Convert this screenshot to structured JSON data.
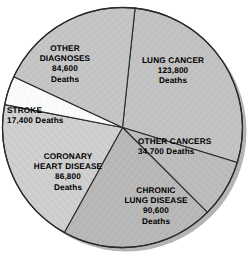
{
  "chart_data": {
    "type": "pie",
    "title": "",
    "subtitle": "",
    "xlabel": "",
    "ylabel": "",
    "unit": "Deaths",
    "total": 437900,
    "legend_position": "none",
    "grid": false,
    "labels_inside_slices": true,
    "categories": [
      "LUNG CANCER",
      "OTHER CANCERS",
      "CHRONIC LUNG DISEASE",
      "CORONARY HEART DISEASE",
      "STROKE",
      "OTHER DIAGNOSES"
    ],
    "values": [
      123800,
      34700,
      90600,
      86800,
      17400,
      84600
    ],
    "value_labels": [
      "123,800",
      "34,700",
      "90,600",
      "86,800",
      "17,400",
      "84,600"
    ],
    "slices": [
      {
        "name": "lung-cancer",
        "label_lines": [
          "LUNG CANCER",
          "123,800",
          "Deaths"
        ],
        "category": "LUNG CANCER",
        "value": 123800,
        "value_label": "123,800",
        "unit": "Deaths",
        "percent": 28.3,
        "start_angle": -84,
        "end_angle": 17,
        "fill": "#c3c3c3"
      },
      {
        "name": "other-cancers",
        "label_lines": [
          "OTHER CANCERS",
          "34,700 Deaths"
        ],
        "category": "OTHER CANCERS",
        "value": 34700,
        "value_label": "34,700",
        "unit": "Deaths",
        "percent": 7.9,
        "start_angle": 17,
        "end_angle": 45,
        "fill": "#bdbdbd"
      },
      {
        "name": "chronic-lung-disease",
        "label_lines": [
          "CHRONIC",
          "LUNG DISEASE",
          "90,600",
          "Deaths"
        ],
        "category": "CHRONIC LUNG DISEASE",
        "value": 90600,
        "value_label": "90,600",
        "unit": "Deaths",
        "percent": 20.7,
        "start_angle": 45,
        "end_angle": 119,
        "fill": "#b8b8b8"
      },
      {
        "name": "coronary-heart-disease",
        "label_lines": [
          "CORONARY",
          "HEART DISEASE",
          "86,800",
          "Deaths"
        ],
        "category": "CORONARY HEART DISEASE",
        "value": 86800,
        "value_label": "86,800",
        "unit": "Deaths",
        "percent": 19.8,
        "start_angle": 119,
        "end_angle": 191,
        "fill": "#cfcfcf"
      },
      {
        "name": "stroke",
        "label_lines": [
          "STROKE",
          "17,400 Deaths"
        ],
        "category": "STROKE",
        "value": 17400,
        "value_label": "17,400",
        "unit": "Deaths",
        "percent": 4.0,
        "start_angle": 191,
        "end_angle": 205,
        "fill": "#fbfbfb"
      },
      {
        "name": "other-diagnoses",
        "label_lines": [
          "OTHER",
          "DIAGNOSES",
          "84,600",
          "Deaths"
        ],
        "category": "OTHER DIAGNOSES",
        "value": 84600,
        "value_label": "84,600",
        "unit": "Deaths",
        "percent": 19.3,
        "start_angle": 205,
        "end_angle": 276,
        "fill": "#c6c6c6"
      }
    ],
    "style": {
      "outline_color": "#2a2a2a",
      "outline_width": 1.1,
      "shadow_color": "#9b9b9b",
      "background": "#ffffff",
      "label_color": "#000000"
    },
    "geometry": {
      "cx": 122.5,
      "cy": 127.5,
      "r": 120
    }
  },
  "labels": {
    "other_diagnoses": {
      "line1": "OTHER",
      "line2": "DIAGNOSES",
      "line3": "84,600",
      "line4": "Deaths"
    },
    "lung_cancer": {
      "line1": "LUNG CANCER",
      "line2": "123,800",
      "line3": "Deaths"
    },
    "stroke": {
      "line1": "STROKE",
      "line2": "17,400 Deaths"
    },
    "other_cancers": {
      "line1": "OTHER CANCERS",
      "line2": "34,700 Deaths"
    },
    "coronary": {
      "line1": "CORONARY",
      "line2": "HEART DISEASE",
      "line3": "86,800",
      "line4": "Deaths"
    },
    "chronic_lung": {
      "line1": "CHRONIC",
      "line2": "LUNG DISEASE",
      "line3": "90,600",
      "line4": "Deaths"
    }
  }
}
